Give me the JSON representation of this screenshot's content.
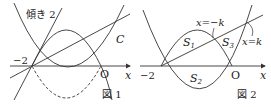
{
  "figure1": {
    "caption": "図 1",
    "slope_label": "傾き 2",
    "curve_label": "C",
    "point_minus2": "−2",
    "origin": "O",
    "axis_x": "x"
  },
  "figure2": {
    "caption": "図 2",
    "label_x_minus_k": "x=−k",
    "label_x_k": "x=k",
    "s1": "S",
    "s1_sub": "1",
    "s2": "S",
    "s2_sub": "2",
    "s3": "S",
    "s3_sub": "3",
    "point_minus2": "−2",
    "origin": "O",
    "axis_x": "x"
  },
  "colors": {
    "stroke": "#333333",
    "background": "#ffffff"
  }
}
